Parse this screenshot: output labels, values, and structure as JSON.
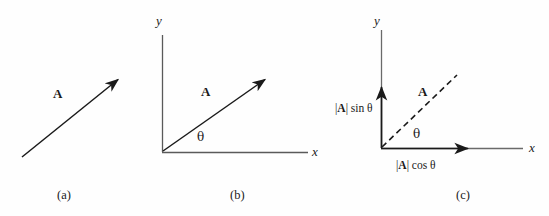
{
  "figure": {
    "background_color": "#fefefe",
    "stroke_color": "#1a1a1a",
    "axis_color": "#555555"
  },
  "panels": [
    {
      "id": "a",
      "caption": "(a)",
      "vector_label": "A",
      "description": "free vector A drawn as a solid arrow without axes",
      "vector": {
        "x1": 22,
        "y1": 157,
        "x2": 120,
        "y2": 78
      }
    },
    {
      "id": "b",
      "caption": "(b)",
      "vector_label": "A",
      "angle_label": "θ",
      "x_axis_label": "x",
      "y_axis_label": "y",
      "description": "vector A placed at the origin of x-y axes with angle theta from x-axis",
      "vector": {
        "x1": 12,
        "y1": 152,
        "x2": 117,
        "y2": 78
      }
    },
    {
      "id": "c",
      "caption": "(c)",
      "vector_label": "A",
      "angle_label": "θ",
      "x_axis_label": "x",
      "y_axis_label": "y",
      "x_component_label_prefix": "|",
      "x_component_label_vector": "A",
      "x_component_label_suffix": "| cos θ",
      "y_component_label_prefix": "|",
      "y_component_label_vector": "A",
      "y_component_label_suffix": "| sin θ",
      "description": "vector A shown dashed with its solid x and y component arrows"
    }
  ]
}
